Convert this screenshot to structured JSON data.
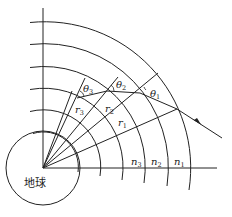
{
  "diagram": {
    "title": "",
    "earth_label": "地球",
    "layers": [
      {
        "name": "n",
        "sub": "3"
      },
      {
        "name": "n",
        "sub": "2"
      },
      {
        "name": "n",
        "sub": "1"
      }
    ],
    "radii_labels": [
      {
        "name": "r",
        "sub": "3"
      },
      {
        "name": "r",
        "sub": "2"
      },
      {
        "name": "r",
        "sub": "1"
      }
    ],
    "angle_labels": [
      {
        "name": "θ",
        "sub": "3"
      },
      {
        "name": "θ",
        "sub": "2"
      },
      {
        "name": "θ",
        "sub": "1"
      }
    ],
    "colors": {
      "line": "#222222",
      "background": "#ffffff"
    }
  }
}
